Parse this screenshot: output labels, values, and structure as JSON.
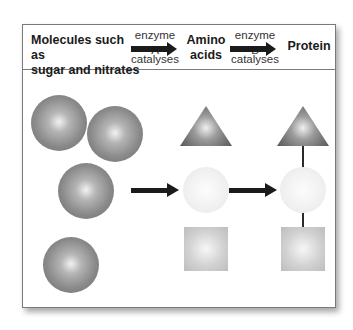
{
  "header": {
    "substrate_line1": "Molecules such as",
    "substrate_line2": "sugar and nitrates",
    "step1": {
      "enzyme": "enzyme A",
      "verb": "catalyses"
    },
    "intermediate_line1": "Amino",
    "intermediate_line2": "acids",
    "step2": {
      "enzyme": "enzyme B",
      "verb": "catalyses"
    },
    "product": "Protein"
  },
  "diagram": {
    "columns": [
      {
        "name": "molecules",
        "shapes": [
          "sphere",
          "sphere",
          "sphere",
          "sphere"
        ]
      },
      {
        "name": "amino-acids",
        "shapes": [
          "triangle",
          "pale-sphere",
          "square"
        ]
      },
      {
        "name": "protein",
        "shapes": [
          "triangle",
          "pale-sphere",
          "square"
        ],
        "bonded": true
      }
    ],
    "colors": {
      "dark_shape": "#8a8a8a",
      "pale_shape": "#f0f0f0",
      "square": "#d2d2d2",
      "arrow": "#1b1b1b",
      "border": "#7a7a7a"
    }
  }
}
